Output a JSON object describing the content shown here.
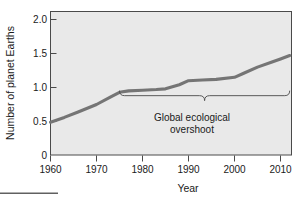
{
  "chart_data": {
    "type": "line",
    "title": "",
    "xlabel": "Year",
    "ylabel": "Number of planet Earths",
    "xlim": [
      1960,
      2014
    ],
    "ylim": [
      0,
      2.0
    ],
    "grid": false,
    "legend": false,
    "x_ticks": [
      "1960",
      "1970",
      "1980",
      "1990",
      "2000",
      "2010"
    ],
    "x_tick_values": [
      1960,
      1970,
      1980,
      1990,
      2000,
      2010
    ],
    "y_ticks": [
      "0",
      "0.5",
      "1.0",
      "1.5",
      "2.0"
    ],
    "y_tick_values": [
      0,
      0.5,
      1.0,
      1.5,
      2.0
    ],
    "series": [
      {
        "name": "Humanity's ecological footprint",
        "color": "#757575",
        "x": [
          1960,
          1963,
          1966,
          1970,
          1973,
          1975,
          1977,
          1980,
          1983,
          1985,
          1988,
          1990,
          1993,
          1996,
          2000,
          2002,
          2005,
          2008,
          2010,
          2012
        ],
        "values": [
          0.49,
          0.56,
          0.64,
          0.75,
          0.86,
          0.93,
          0.95,
          0.96,
          0.97,
          0.98,
          1.04,
          1.1,
          1.11,
          1.12,
          1.15,
          1.21,
          1.3,
          1.37,
          1.42,
          1.47
        ]
      }
    ],
    "annotations": [
      {
        "name": "global-ecological-overshoot",
        "text_line_1": "Global ecological",
        "text_line_2": "overshoot",
        "brace_x_start": 1975,
        "brace_x_end": 2012,
        "brace_y": 0.88
      }
    ]
  },
  "axis": {
    "y_title": "Number of planet Earths",
    "x_title": "Year",
    "y_tick_0": "0",
    "y_tick_1": "0.5",
    "y_tick_2": "1.0",
    "y_tick_3": "1.5",
    "y_tick_4": "2.0",
    "x_tick_0": "1960",
    "x_tick_1": "1970",
    "x_tick_2": "1980",
    "x_tick_3": "1990",
    "x_tick_4": "2000",
    "x_tick_5": "2010"
  },
  "annotation": {
    "line_1": "Global ecological",
    "line_2": "overshoot"
  },
  "colors": {
    "line": "#757575",
    "plot_background": "#e9e9e9",
    "axis": "#4a4a4a",
    "text": "#1a1a1a",
    "page_background": "#ffffff"
  }
}
